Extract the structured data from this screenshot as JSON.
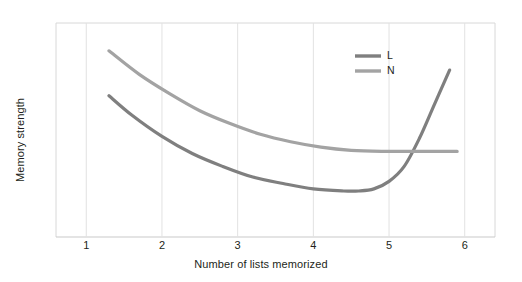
{
  "chart_data": {
    "type": "line",
    "title": "",
    "subtitle": "",
    "xlabel": "Number of lists memorized",
    "ylabel": "Memory strength",
    "xlim": [
      0.6,
      6.4
    ],
    "ylim": [
      0,
      100
    ],
    "xticks": [
      1,
      2,
      3,
      4,
      5,
      6
    ],
    "xtick_labels": [
      "1",
      "2",
      "3",
      "4",
      "5",
      "6"
    ],
    "yticks": [],
    "ytick_labels": [],
    "grid": "vertical",
    "legend_position": "top-right",
    "series": [
      {
        "name": "L",
        "color": "#7f7f7f",
        "x": [
          1.3,
          1.6,
          2.0,
          2.4,
          2.8,
          3.2,
          3.6,
          4.0,
          4.4,
          4.6,
          4.8,
          5.0,
          5.2,
          5.4,
          5.6,
          5.8
        ],
        "values": [
          66,
          57,
          47,
          39,
          33,
          28,
          25,
          22.5,
          21.5,
          21.5,
          22.5,
          26,
          33,
          46,
          62,
          78
        ]
      },
      {
        "name": "N",
        "color": "#a3a3a3",
        "x": [
          1.3,
          1.7,
          2.1,
          2.5,
          2.9,
          3.3,
          3.7,
          4.1,
          4.5,
          4.9,
          5.3,
          5.7,
          5.9
        ],
        "values": [
          87,
          76,
          67,
          59,
          53,
          48,
          44.5,
          42,
          40.5,
          40,
          40,
          40,
          40
        ]
      }
    ],
    "annotations": []
  },
  "legend": {
    "entries": [
      {
        "label": "L",
        "color": "#7f7f7f"
      },
      {
        "label": "N",
        "color": "#a3a3a3"
      }
    ]
  },
  "axes": {
    "x_title": "Number of lists memorized",
    "y_title": "Memory strength",
    "x_tick_labels": [
      "1",
      "2",
      "3",
      "4",
      "5",
      "6"
    ]
  },
  "style": {
    "background": "#ffffff",
    "grid_color": "#e2e2e2",
    "axis_color": "#c9c9c9",
    "text_color": "#231f20"
  }
}
